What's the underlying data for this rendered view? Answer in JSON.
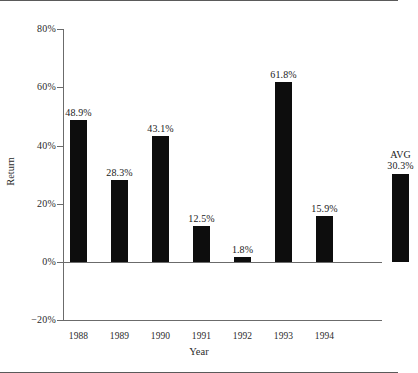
{
  "chart_data": {
    "type": "bar",
    "title": "",
    "xlabel": "Year",
    "ylabel": "Return",
    "ylim": [
      -20,
      80
    ],
    "grid": false,
    "legend": "none",
    "y_ticks": [
      "80%",
      "60%",
      "40%",
      "20%",
      "0%",
      "-20%"
    ],
    "y_tick_values": [
      80,
      60,
      40,
      20,
      0,
      -20
    ],
    "categories": [
      "1988",
      "1989",
      "1990",
      "1991",
      "1992",
      "1993",
      "1994",
      ""
    ],
    "values": [
      48.9,
      28.3,
      43.1,
      12.5,
      1.8,
      61.8,
      15.9,
      30.3
    ],
    "data_labels": [
      "48.9%",
      "28.3%",
      "43.1%",
      "12.5%",
      "1.8%",
      "61.8%",
      "15.9%",
      "AVG\n30.3%"
    ],
    "bar_color": "#0d0d0d",
    "axis_color": "#6b6b6b",
    "series": [
      {
        "name": "Return",
        "values": [
          48.9,
          28.3,
          43.1,
          12.5,
          1.8,
          61.8,
          15.9,
          30.3
        ]
      }
    ],
    "annotations": [
      {
        "text": "AVG",
        "applies_to": "last-bar",
        "meaning": "average of 1988-1994 returns"
      }
    ]
  },
  "axes": {
    "y_title": "Return",
    "x_title": "Year",
    "y_labels": [
      {
        "text": "80%",
        "value": 80
      },
      {
        "text": "60%",
        "value": 60
      },
      {
        "text": "40%",
        "value": 40
      },
      {
        "text": "20%",
        "value": 20
      },
      {
        "text": "0%",
        "value": 0
      },
      {
        "text": "−20%",
        "value": -20
      }
    ],
    "x_labels": [
      "1988",
      "1989",
      "1990",
      "1991",
      "1992",
      "1993",
      "1994"
    ]
  },
  "bars": [
    {
      "label": "48.9%",
      "value": 48.9,
      "category": "1988"
    },
    {
      "label": "28.3%",
      "value": 28.3,
      "category": "1989"
    },
    {
      "label": "43.1%",
      "value": 43.1,
      "category": "1990"
    },
    {
      "label": "12.5%",
      "value": 12.5,
      "category": "1991"
    },
    {
      "label": "1.8%",
      "value": 1.8,
      "category": "1992"
    },
    {
      "label": "61.8%",
      "value": 61.8,
      "category": "1993"
    },
    {
      "label": "15.9%",
      "value": 15.9,
      "category": "1994"
    },
    {
      "label": "AVG\n30.3%",
      "value": 30.3,
      "category": "AVG"
    }
  ]
}
